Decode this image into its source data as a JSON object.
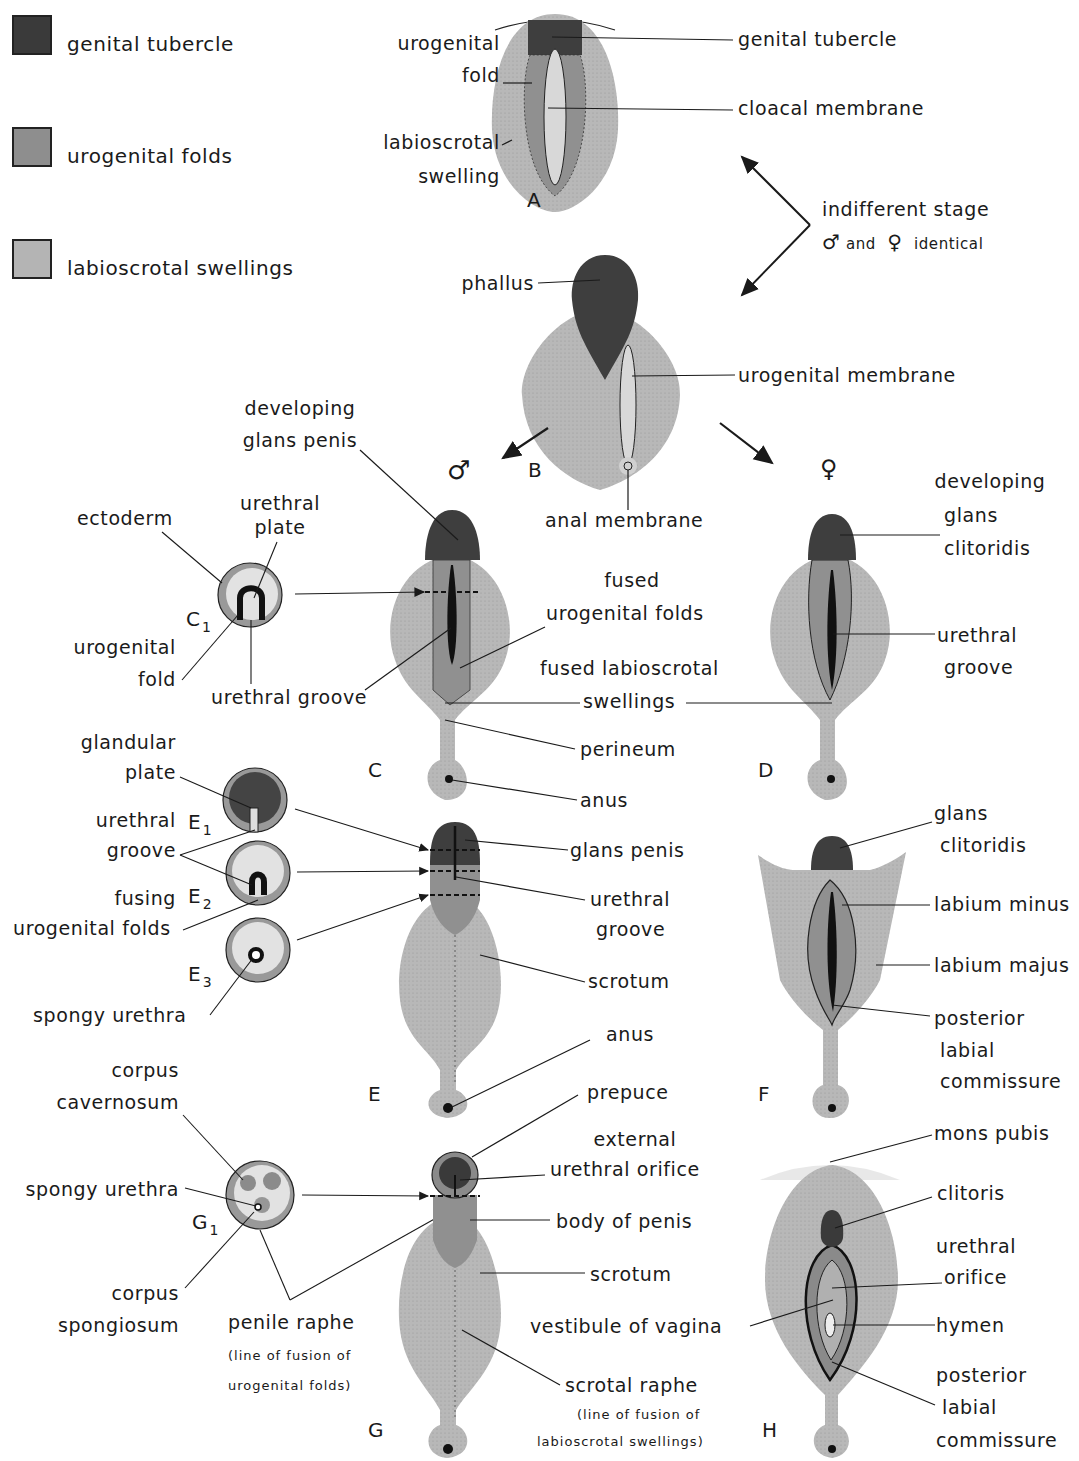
{
  "legend": {
    "items": [
      {
        "label": "genital tubercle",
        "color": "#3a3a3a"
      },
      {
        "label": "urogenital folds",
        "color": "#8e8e8e"
      },
      {
        "label": "labioscrotal swellings",
        "color": "#b4b4b4"
      }
    ]
  },
  "colors": {
    "tubercle": "#3c3c3c",
    "folds": "#8f8f8f",
    "swellings": "#b8b8b8",
    "membrane": "#d8d8d8",
    "line": "#1a1a1a"
  },
  "panels": {
    "A": {
      "letter": "A",
      "labels": {
        "urogenital_fold_1": "urogenital",
        "urogenital_fold_2": "fold",
        "labioscrotal_1": "labioscrotal",
        "labioscrotal_2": "swelling",
        "genital_tubercle": "genital tubercle",
        "cloacal_membrane": "cloacal membrane"
      }
    },
    "indifferent": {
      "line1": "indifferent stage",
      "male_symbol": "♂",
      "and": "and",
      "female_symbol": "♀",
      "identical": "identical"
    },
    "B": {
      "letter": "B",
      "male_symbol": "♂",
      "female_symbol": "♀",
      "labels": {
        "phallus": "phallus",
        "urogenital_membrane": "urogenital membrane",
        "anal_membrane": "anal membrane"
      }
    },
    "C": {
      "letter": "C",
      "labels": {
        "developing_1": "developing",
        "developing_2": "glans penis",
        "fused_uf_1": "fused",
        "fused_uf_2": "urogenital folds",
        "fused_ls_1": "fused labioscrotal",
        "fused_ls_2": "swellings",
        "perineum": "perineum",
        "anus": "anus",
        "urethral_groove": "urethral groove"
      }
    },
    "C1": {
      "letter": "C",
      "sub": "1",
      "labels": {
        "ectoderm": "ectoderm",
        "urethral_plate_1": "urethral",
        "urethral_plate_2": "plate",
        "urogenital_fold_1": "urogenital",
        "urogenital_fold_2": "fold"
      }
    },
    "D": {
      "letter": "D",
      "labels": {
        "developing_1": "developing",
        "developing_2": "glans",
        "developing_3": "clitoridis",
        "urethral_1": "urethral",
        "urethral_2": "groove"
      }
    },
    "E": {
      "letter": "E",
      "labels": {
        "glans_penis": "glans penis",
        "urethral_1": "urethral",
        "urethral_2": "groove",
        "scrotum": "scrotum",
        "anus": "anus"
      }
    },
    "E_sections": {
      "E1": {
        "letter": "E",
        "sub": "1"
      },
      "E2": {
        "letter": "E",
        "sub": "2"
      },
      "E3": {
        "letter": "E",
        "sub": "3"
      },
      "labels": {
        "glandular_1": "glandular",
        "glandular_2": "plate",
        "urethral_1": "urethral",
        "urethral_2": "groove",
        "fusing": "fusing",
        "fusing_2": "urogenital folds",
        "spongy_urethra": "spongy urethra"
      }
    },
    "F": {
      "letter": "F",
      "labels": {
        "glans_1": "glans",
        "glans_2": "clitoridis",
        "labium_minus": "labium minus",
        "labium_majus": "labium majus",
        "posterior_1": "posterior",
        "posterior_2": "labial",
        "posterior_3": "commissure"
      }
    },
    "G": {
      "letter": "G",
      "labels": {
        "prepuce": "prepuce",
        "external_1": "external",
        "external_2": "urethral orifice",
        "body_of_penis": "body of penis",
        "scrotum": "scrotum",
        "scrotal_raphe": "scrotal raphe",
        "scrotal_raphe_note_1": "(line of fusion of",
        "scrotal_raphe_note_2": "labioscrotal  swellings)"
      }
    },
    "G1": {
      "letter": "G",
      "sub": "1",
      "labels": {
        "corpus_cav_1": "corpus",
        "corpus_cav_2": "cavernosum",
        "spongy_urethra": "spongy urethra",
        "corpus_spong_1": "corpus",
        "corpus_spong_2": "spongiosum",
        "penile_raphe": "penile  raphe",
        "penile_note_1": "(line of fusion of",
        "penile_note_2": "urogenital folds)"
      }
    },
    "H": {
      "letter": "H",
      "labels": {
        "mons_pubis": "mons pubis",
        "clitoris": "clitoris",
        "urethral_1": "urethral",
        "urethral_2": "orifice",
        "vestibule": "vestibule of vagina",
        "hymen": "hymen",
        "posterior_1": "posterior",
        "posterior_2": "labial",
        "posterior_3": "commissure"
      }
    }
  }
}
